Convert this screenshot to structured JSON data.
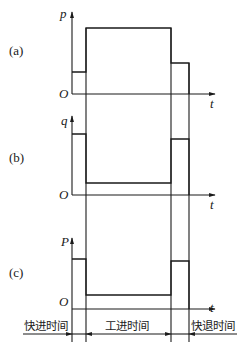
{
  "panels": [
    {
      "id": "a",
      "label": "(a)",
      "y_axis_label": "p",
      "origin_label": "O",
      "x_axis_label": "t",
      "profile": "pressure: low during rapid advance, high during work feed, medium during rapid return"
    },
    {
      "id": "b",
      "label": "(b)",
      "y_axis_label": "q",
      "origin_label": "O",
      "x_axis_label": "t",
      "profile": "flow: high during rapid advance, low during work feed, high during rapid return"
    },
    {
      "id": "c",
      "label": "(c)",
      "y_axis_label": "P",
      "origin_label": "O",
      "x_axis_label": "t",
      "profile": "power: high during rapid advance, low during work feed, high during rapid return"
    }
  ],
  "phases": [
    {
      "key": "rapid_advance",
      "label": "快进时间"
    },
    {
      "key": "work_feed",
      "label": "工进时间"
    },
    {
      "key": "rapid_return",
      "label": "快退时间"
    }
  ],
  "colors": {
    "line": "#1a1a1a",
    "background": "#ffffff"
  }
}
